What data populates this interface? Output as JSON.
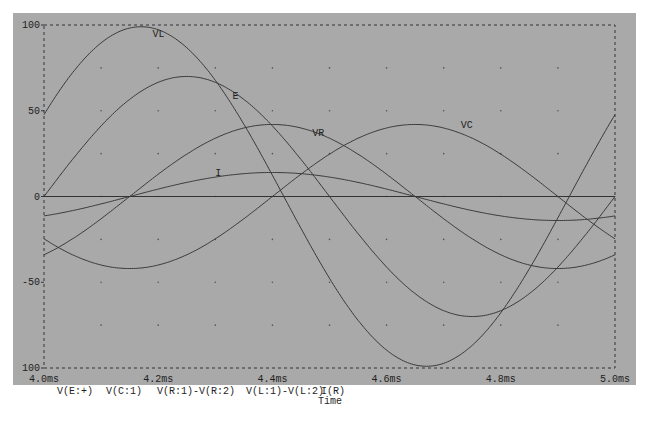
{
  "chart_data": {
    "type": "line",
    "title": "",
    "xlabel": "Time",
    "ylabel": "",
    "xlim_ms": [
      4.0,
      5.0
    ],
    "ylim": [
      -100,
      100
    ],
    "x_tick_labels": [
      "4.0ms",
      "4.2ms",
      "4.4ms",
      "4.6ms",
      "4.8ms",
      "5.0ms"
    ],
    "y_tick_labels": [
      "100",
      "50",
      "0",
      "-50",
      "100"
    ],
    "grid": "dotted",
    "legend_entries": [
      "V(E:+)",
      "V(C:1)",
      "V(R:1)-V(R:2)",
      "V(L:1)-V(L:2)",
      "I(R)"
    ],
    "series": [
      {
        "name": "VL",
        "trace": "V(L:1)-V(L:2)",
        "amplitude": 99,
        "peak_time_ms": 4.17,
        "period_ms": 1.0
      },
      {
        "name": "E",
        "trace": "V(E:+)",
        "amplitude": 70,
        "peak_time_ms": 4.25,
        "period_ms": 1.0
      },
      {
        "name": "VR",
        "trace": "V(R:1)-V(R:2)",
        "amplitude": 42,
        "peak_time_ms": 4.4,
        "period_ms": 1.0
      },
      {
        "name": "I",
        "trace": "I(R)",
        "amplitude": 14,
        "peak_time_ms": 4.4,
        "period_ms": 1.0
      },
      {
        "name": "VC",
        "trace": "V(C:1)",
        "amplitude": 42,
        "peak_time_ms": 4.65,
        "period_ms": 1.0
      }
    ],
    "curve_labels": [
      {
        "text": "VL",
        "x_ms": 4.19,
        "y": 93
      },
      {
        "text": "E",
        "x_ms": 4.33,
        "y": 57
      },
      {
        "text": "VR",
        "x_ms": 4.47,
        "y": 35
      },
      {
        "text": "I",
        "x_ms": 4.3,
        "y": 12
      },
      {
        "text": "VC",
        "x_ms": 4.73,
        "y": 40
      }
    ]
  },
  "legend": {
    "items": [
      "V(E:+)",
      "V(C:1)",
      "V(R:1)-V(R:2)",
      "V(L:1)-V(L:2)",
      "I(R)"
    ],
    "x_axis_title": "Time"
  }
}
